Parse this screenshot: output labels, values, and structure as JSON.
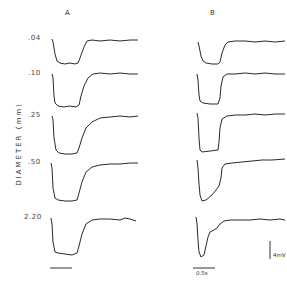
{
  "figure": {
    "panels": [
      {
        "label": "A"
      },
      {
        "label": "B"
      }
    ],
    "y_axis_label": "DIAMETER (mm)",
    "rows": [
      {
        "diameter": ".04"
      },
      {
        "diameter": ".10"
      },
      {
        "diameter": ".25"
      },
      {
        "diameter": ".50"
      },
      {
        "diameter": "2.20"
      }
    ],
    "scale_bars": {
      "time": "0.5s",
      "voltage": "4mV"
    }
  }
}
